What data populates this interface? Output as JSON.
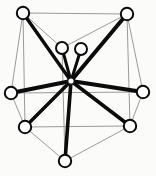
{
  "figure": {
    "width": 156,
    "height": 176,
    "background_color": "#fbfbfa",
    "node_fill_color": "#ffffff",
    "node_stroke_color": "#0b0b0b",
    "spoke_color": "#0b0b0b",
    "frame_color": "#9a9a9a"
  },
  "chart_data": {
    "type": "scatter",
    "title": "",
    "xlabel": "",
    "ylabel": "",
    "grid": false,
    "legend": "none",
    "xlim": [
      0,
      156
    ],
    "ylim": [
      0,
      176
    ],
    "hub": {
      "id": "hub",
      "x": 71,
      "y": 81,
      "r": 3.2
    },
    "nodes": [
      {
        "id": "n1",
        "label": "top-left",
        "x": 23,
        "y": 13,
        "r": 6.2
      },
      {
        "id": "n2",
        "label": "top-right",
        "x": 127,
        "y": 14,
        "r": 6.2
      },
      {
        "id": "n3",
        "label": "inner-left",
        "x": 62,
        "y": 48,
        "r": 6.0
      },
      {
        "id": "n4",
        "label": "inner-right",
        "x": 81,
        "y": 49,
        "r": 6.0
      },
      {
        "id": "n5",
        "label": "left",
        "x": 11,
        "y": 93,
        "r": 6.2
      },
      {
        "id": "n6",
        "label": "right",
        "x": 143,
        "y": 92,
        "r": 6.2
      },
      {
        "id": "n7",
        "label": "bottom-left",
        "x": 25,
        "y": 127,
        "r": 6.2
      },
      {
        "id": "n8",
        "label": "bottom-right",
        "x": 130,
        "y": 126,
        "r": 6.2
      },
      {
        "id": "n9",
        "label": "bottom",
        "x": 65,
        "y": 161,
        "r": 6.2
      }
    ],
    "spokes": [
      {
        "from": "hub",
        "to": "n1",
        "width": 3.4
      },
      {
        "from": "hub",
        "to": "n2",
        "width": 4.0
      },
      {
        "from": "hub",
        "to": "n3",
        "width": 3.0
      },
      {
        "from": "hub",
        "to": "n4",
        "width": 3.0
      },
      {
        "from": "hub",
        "to": "n5",
        "width": 4.2
      },
      {
        "from": "hub",
        "to": "n6",
        "width": 4.0
      },
      {
        "from": "hub",
        "to": "n7",
        "width": 3.4
      },
      {
        "from": "hub",
        "to": "n8",
        "width": 3.6
      },
      {
        "from": "hub",
        "to": "n9",
        "width": 3.6
      }
    ],
    "frame_edges": [
      {
        "from": "n1",
        "to": "n2"
      },
      {
        "from": "n1",
        "to": "n7"
      },
      {
        "from": "n2",
        "to": "n8"
      },
      {
        "from": "n7",
        "to": "n8"
      },
      {
        "from": "n1",
        "to": "n3"
      },
      {
        "from": "n2",
        "to": "n3"
      },
      {
        "from": "n3",
        "to": "n9"
      },
      {
        "from": "n5",
        "to": "n1"
      },
      {
        "from": "n5",
        "to": "n7"
      },
      {
        "from": "n6",
        "to": "n2"
      },
      {
        "from": "n6",
        "to": "n8"
      },
      {
        "from": "n7",
        "to": "n9"
      },
      {
        "from": "n8",
        "to": "n9"
      },
      {
        "from": "n5",
        "to": "n6"
      }
    ]
  }
}
